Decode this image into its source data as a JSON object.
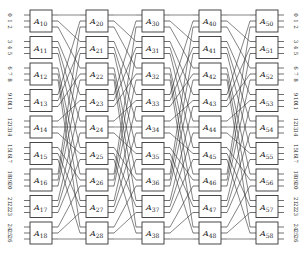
{
  "diagram": {
    "type": "multistage-shuffle-network",
    "stages": 5,
    "boxes_per_stage": 9,
    "ports_per_box": 3,
    "box_label_prefix": "A",
    "columns": [
      {
        "stage": 1,
        "boxes": [
          "10",
          "11",
          "12",
          "13",
          "14",
          "15",
          "16",
          "17",
          "18"
        ]
      },
      {
        "stage": 2,
        "boxes": [
          "20",
          "21",
          "22",
          "23",
          "24",
          "25",
          "26",
          "27",
          "28"
        ]
      },
      {
        "stage": 3,
        "boxes": [
          "30",
          "31",
          "32",
          "33",
          "34",
          "35",
          "36",
          "37",
          "38"
        ]
      },
      {
        "stage": 4,
        "boxes": [
          "40",
          "41",
          "42",
          "43",
          "44",
          "45",
          "46",
          "47",
          "48"
        ]
      },
      {
        "stage": 5,
        "boxes": [
          "50",
          "51",
          "52",
          "53",
          "54",
          "55",
          "56",
          "57",
          "58"
        ]
      }
    ],
    "input_labels": [
      [
        "0",
        "1",
        "2"
      ],
      [
        "3",
        "4",
        "5"
      ],
      [
        "6",
        "7",
        "8"
      ],
      [
        "9",
        "10",
        "11"
      ],
      [
        "12",
        "13",
        "14"
      ],
      [
        "15",
        "16",
        "17"
      ],
      [
        "18",
        "19",
        "20"
      ],
      [
        "21",
        "22",
        "23"
      ],
      [
        "24",
        "25",
        "26"
      ]
    ],
    "output_labels": [
      [
        "0",
        "1",
        "2"
      ],
      [
        "3",
        "4",
        "5"
      ],
      [
        "6",
        "7",
        "8"
      ],
      [
        "9",
        "10",
        "11"
      ],
      [
        "12",
        "13",
        "14"
      ],
      [
        "15",
        "16",
        "17"
      ],
      [
        "18",
        "19",
        "20"
      ],
      [
        "21",
        "22",
        "23"
      ],
      [
        "24",
        "25",
        "26"
      ]
    ],
    "interconnect_rule": "output j of box i (wire w = 3i+j) connects to box (w mod 9), input slot floor(w/9)",
    "colors": {
      "line": "#333333",
      "background": "#ffffff"
    }
  }
}
